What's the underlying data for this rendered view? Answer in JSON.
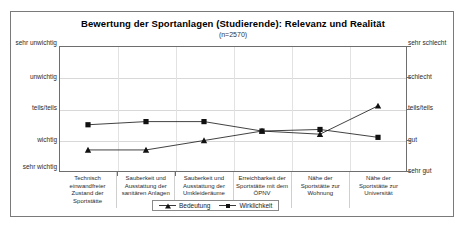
{
  "top_crop_text": "",
  "chart_data": {
    "type": "line",
    "title": "Bewertung der Sportanlagen (Studierende): Relevanz und Realität",
    "subtitle": "(n=2570)",
    "categories": [
      "Technisch einwandfreier Zustand der Sportstätte",
      "Sauberkeit und Ausstattung der sanitären Anlagen",
      "Sauberkeit und Ausstattung der Umkleideräume",
      "Erreichbarkeit der Sportstätte mit dem ÖPNV",
      "Nähe der Sportstätte zur Wohnung",
      "Nähe der Sportstätte zur Universität"
    ],
    "series": [
      {
        "name": "Bedeutung",
        "marker": "triangle",
        "color": "#111111",
        "values": [
          4.3,
          4.3,
          4.0,
          3.7,
          3.8,
          2.9
        ]
      },
      {
        "name": "Wirklichkeit",
        "marker": "square",
        "color": "#111111",
        "values": [
          3.5,
          3.4,
          3.4,
          3.7,
          3.65,
          3.9
        ]
      }
    ],
    "ylim": [
      1,
      5
    ],
    "grid": true,
    "legend_position": "bottom",
    "y_axis_left": {
      "label": "",
      "ticks": [
        {
          "value": 1,
          "label": "sehr unwichtig"
        },
        {
          "value": 2,
          "label": "unwichtig"
        },
        {
          "value": 3,
          "label": "teils/teils"
        },
        {
          "value": 4,
          "label": "wichtig"
        },
        {
          "value": 5,
          "label": "sehr wichtig"
        }
      ]
    },
    "y_axis_right": {
      "label": "",
      "ticks": [
        {
          "value": 1,
          "label": "sehr schlecht"
        },
        {
          "value": 2,
          "label": "schlecht"
        },
        {
          "value": 3,
          "label": "teils/teils"
        },
        {
          "value": 4,
          "label": "gut"
        },
        {
          "value": 5,
          "label": "sehr gut"
        }
      ]
    },
    "xlabel": "",
    "ylabel": ""
  },
  "legend": {
    "items": [
      {
        "label": "Bedeutung"
      },
      {
        "label": "Wirklichkeit"
      }
    ]
  }
}
